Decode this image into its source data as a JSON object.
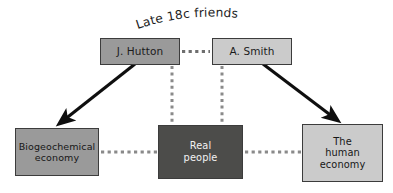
{
  "figure": {
    "title": "Late 18c friends",
    "type": "concept-diagram",
    "background_color": "#ffffff"
  },
  "nodes": [
    {
      "id": "hutton",
      "label": "J. Hutton",
      "row": "top",
      "fill": "#9a9a9a",
      "text_color": "#1b1b1b",
      "border_color": "#3c3c3c"
    },
    {
      "id": "smith",
      "label": "A. Smith",
      "row": "top",
      "fill": "#cbcbcb",
      "text_color": "#1b1b1b",
      "border_color": "#3c3c3c"
    },
    {
      "id": "biogeochemical",
      "label": "Biogeochemical\neconomy",
      "row": "bottom",
      "fill": "#9a9a9a",
      "text_color": "#171717",
      "border_color": "#3c3c3c"
    },
    {
      "id": "real-people",
      "label": "Real\npeople",
      "row": "bottom",
      "fill": "#4c4c4a",
      "text_color": "#f2f2f2",
      "border_color": "#3c3c3c"
    },
    {
      "id": "human-economy",
      "label": "The\nhuman\neconomy",
      "row": "bottom",
      "fill": "#cbcbcb",
      "text_color": "#171717",
      "border_color": "#3c3c3c"
    }
  ],
  "edges": [
    {
      "id": "hutton-smith",
      "from": "hutton",
      "to": "smith",
      "style": "dotted",
      "color": "#6e6e6e",
      "arrow": false
    },
    {
      "id": "hutton-biogeochemical",
      "from": "hutton",
      "to": "biogeochemical",
      "style": "solid",
      "color": "#0f0f0f",
      "arrow": true
    },
    {
      "id": "smith-human-economy",
      "from": "smith",
      "to": "human-economy",
      "style": "solid",
      "color": "#0f0f0f",
      "arrow": true
    },
    {
      "id": "hutton-real-people",
      "from": "hutton",
      "to": "real-people",
      "style": "dotted",
      "color": "#8a8a8a",
      "arrow": false
    },
    {
      "id": "smith-real-people",
      "from": "smith",
      "to": "real-people",
      "style": "dotted",
      "color": "#8a8a8a",
      "arrow": false
    },
    {
      "id": "biogeochemical-real-people",
      "from": "biogeochemical",
      "to": "real-people",
      "style": "dotted",
      "color": "#8a8a8a",
      "arrow": false
    },
    {
      "id": "real-people-human-economy",
      "from": "real-people",
      "to": "human-economy",
      "style": "dotted",
      "color": "#8a8a8a",
      "arrow": false
    }
  ]
}
